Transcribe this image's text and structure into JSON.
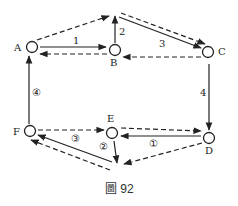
{
  "diagram": {
    "caption": "圖 92",
    "nodes": [
      {
        "id": "A",
        "label": "A"
      },
      {
        "id": "B",
        "label": "B"
      },
      {
        "id": "C",
        "label": "C"
      },
      {
        "id": "D",
        "label": "D"
      },
      {
        "id": "E",
        "label": "E"
      },
      {
        "id": "F",
        "label": "F"
      }
    ],
    "edge_labels": {
      "ab": "1",
      "b_up": "2",
      "top_c": "3",
      "cd": "4",
      "de": "①",
      "e_down": "②",
      "fe": "③",
      "fa": "④"
    },
    "edges": [
      {
        "from": "A",
        "to": "B",
        "style": "solid",
        "label": "1"
      },
      {
        "from": "B",
        "to": "A",
        "style": "dashed"
      },
      {
        "from": "B",
        "to": "top-apex",
        "style": "solid",
        "label": "2"
      },
      {
        "from": "A",
        "to": "top-apex",
        "style": "dashed"
      },
      {
        "from": "top-apex",
        "to": "C",
        "style": "solid",
        "label": "3"
      },
      {
        "from": "top-apex",
        "to": "C",
        "style": "dashed"
      },
      {
        "from": "C",
        "to": "B",
        "style": "dashed"
      },
      {
        "from": "C",
        "to": "D",
        "style": "solid",
        "label": "4"
      },
      {
        "from": "D",
        "to": "E",
        "style": "solid",
        "label": "①"
      },
      {
        "from": "E",
        "to": "D",
        "style": "dashed"
      },
      {
        "from": "F",
        "to": "E",
        "style": "dashed",
        "label": "③"
      },
      {
        "from": "E",
        "to": "bottom-apex",
        "style": "solid",
        "label": "②"
      },
      {
        "from": "D",
        "to": "bottom-apex",
        "style": "dashed"
      },
      {
        "from": "bottom-apex",
        "to": "F",
        "style": "solid"
      },
      {
        "from": "bottom-apex",
        "to": "F",
        "style": "dashed"
      },
      {
        "from": "F",
        "to": "A",
        "style": "solid",
        "label": "④"
      }
    ]
  }
}
